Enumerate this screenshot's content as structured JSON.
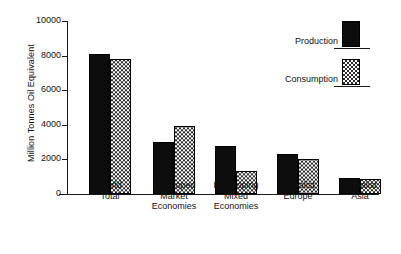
{
  "chart_data": {
    "type": "bar",
    "title": "",
    "subtitle": "",
    "xlabel": "",
    "ylabel": "Million Tonnes Oil Equivalent",
    "ylim": [
      0,
      10000
    ],
    "yticks": [
      0,
      2000,
      4000,
      6000,
      8000,
      10000
    ],
    "ytick_labels": [
      "0",
      "2000",
      "4000",
      "6000",
      "8000",
      "10000"
    ],
    "grid": false,
    "legend_position": "top-right",
    "categories": [
      "World Total",
      "Developed Market Economies",
      "Developing Mixed Economies",
      "Socialist Europe",
      "Socialist Asia"
    ],
    "category_lines": [
      [
        "World",
        "Total"
      ],
      [
        "Developed",
        "Market",
        "Economies"
      ],
      [
        "Developing",
        "Mixed",
        "Economies"
      ],
      [
        "Socialist",
        "Europe"
      ],
      [
        "Socialist",
        "Asia"
      ]
    ],
    "series": [
      {
        "name": "Production",
        "fill": "solid-black",
        "color": "#0d0d0d",
        "values": [
          8080,
          3020,
          2800,
          2300,
          900
        ]
      },
      {
        "name": "Consumption",
        "fill": "checkered",
        "color": "#2b2b2b",
        "values": [
          7820,
          3950,
          1350,
          2000,
          880
        ]
      }
    ]
  },
  "axes": {
    "y_title": "Million Tonnes Oil Equivalent"
  },
  "legend": {
    "items": [
      {
        "label": "Production",
        "swatch": "solid-black-bar"
      },
      {
        "label": "Consumption",
        "swatch": "checkered-bar"
      }
    ]
  }
}
